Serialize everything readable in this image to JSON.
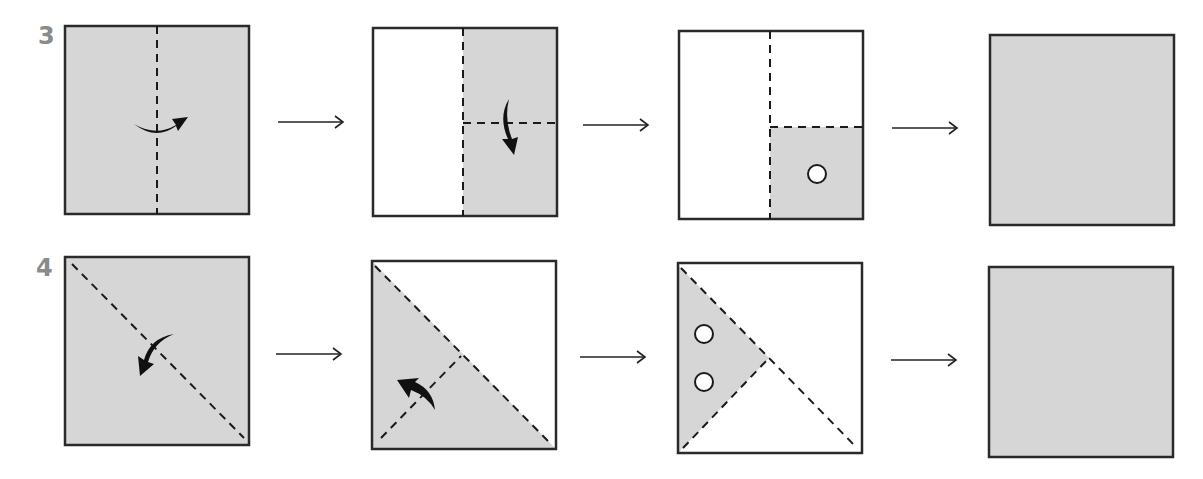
{
  "diagram": {
    "type": "paper-folding-sequence",
    "colors": {
      "paper_shaded": "#d6d6d6",
      "paper_blank": "#ffffff",
      "outline": "#2a2a2a",
      "label": "#8a8a8a"
    },
    "rows": [
      {
        "label": "3",
        "steps": [
          "Square shaded, vertical dashed fold line at center, curved arrow folding right",
          "Left half blank, right half shaded, horizontal dashed line across right half, curved arrow folding down",
          "Bottom-right quadrant shaded with one punched hole",
          "Blank shaded square (answer)"
        ]
      },
      {
        "label": "4",
        "steps": [
          "Square shaded, diagonal dashed fold line top-left to bottom-right, curved arrow folding down-left",
          "Lower-left triangle shaded, dashed line from bottom-left to midpoint of diagonal, curved arrow folding up-left",
          "Left triangle shaded with two punched holes",
          "Blank shaded square (answer)"
        ]
      }
    ],
    "step_arrow": "→"
  }
}
